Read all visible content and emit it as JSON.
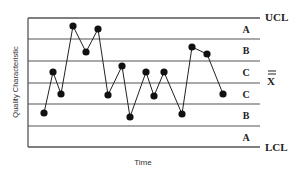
{
  "chart_data": {
    "type": "line",
    "title": "",
    "subtitle": "Control chart with zones A, B, C",
    "xlabel": "Time",
    "ylabel": "Quality Characteristic",
    "grid": false,
    "legend": null,
    "limits": {
      "ucl_label": "UCL",
      "center_label": "X",
      "center_overline": "double-bar",
      "lcl_label": "LCL"
    },
    "zones_top_to_bottom": [
      "A",
      "B",
      "C",
      "C",
      "B",
      "A"
    ],
    "ylim_sigma": [
      -3,
      3
    ],
    "x": [
      1,
      2,
      3,
      4,
      5,
      6,
      7,
      8,
      9,
      10,
      11,
      12,
      13,
      14,
      15,
      16
    ],
    "values_sigma": [
      -2.4,
      -0.5,
      -1.5,
      2.6,
      1.4,
      2.5,
      -1.6,
      0.2,
      -2.6,
      -0.5,
      -1.6,
      -0.5,
      -2.4,
      0.7,
      0.4,
      -1.5
    ],
    "series": [
      {
        "name": "Quality Characteristic",
        "points_px": [
          [
            44,
            113
          ],
          [
            53,
            72
          ],
          [
            61,
            94
          ],
          [
            73,
            26
          ],
          [
            86,
            52
          ],
          [
            98,
            29
          ],
          [
            108,
            95
          ],
          [
            122,
            66
          ],
          [
            130,
            117
          ],
          [
            146,
            72
          ],
          [
            154,
            96
          ],
          [
            164,
            72
          ],
          [
            182,
            114
          ],
          [
            192,
            47
          ],
          [
            207,
            54
          ],
          [
            223,
            94
          ]
        ]
      }
    ]
  },
  "layout": {
    "plot_left": 28,
    "plot_right": 260,
    "line_y": [
      18,
      39,
      61,
      83,
      104,
      126,
      147
    ],
    "colors": {
      "line": "#555555",
      "marker": "#111111",
      "text": "#222222"
    }
  }
}
